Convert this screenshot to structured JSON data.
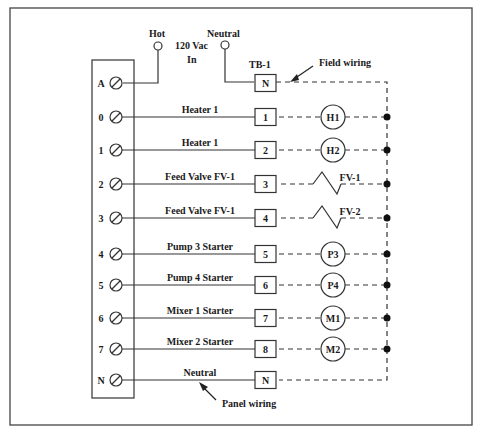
{
  "diagram": {
    "type": "wiring-diagram",
    "frame": {
      "x": 10,
      "y": 8,
      "w": 462,
      "h": 417
    },
    "power_in": {
      "hot_label": "Hot",
      "neutral_label": "Neutral",
      "supply_label_line1": "120 Vac",
      "supply_label_line2": "In"
    },
    "terminal_block_label": "TB-1",
    "annotations": {
      "field_wiring": "Field wiring",
      "panel_wiring": "Panel wiring"
    },
    "rows": [
      {
        "terminal": "A",
        "wire_label": "",
        "tb": "N",
        "device": "",
        "device_type": "none",
        "y": 83
      },
      {
        "terminal": "0",
        "wire_label": "Heater 1",
        "tb": "1",
        "device": "H1",
        "device_type": "circle",
        "y": 117
      },
      {
        "terminal": "1",
        "wire_label": "Heater 1",
        "tb": "2",
        "device": "H2",
        "device_type": "circle",
        "y": 150
      },
      {
        "terminal": "2",
        "wire_label": "Feed Valve FV-1",
        "tb": "3",
        "device": "FV-1",
        "device_type": "valve",
        "y": 184
      },
      {
        "terminal": "3",
        "wire_label": "Feed Valve FV-1",
        "tb": "4",
        "device": "FV-2",
        "device_type": "valve",
        "y": 218
      },
      {
        "terminal": "4",
        "wire_label": "Pump 3 Starter",
        "tb": "5",
        "device": "P3",
        "device_type": "circle",
        "y": 254
      },
      {
        "terminal": "5",
        "wire_label": "Pump 4 Starter",
        "tb": "6",
        "device": "P4",
        "device_type": "circle",
        "y": 285
      },
      {
        "terminal": "6",
        "wire_label": "Mixer  1 Starter",
        "tb": "7",
        "device": "M1",
        "device_type": "circle",
        "y": 318
      },
      {
        "terminal": "7",
        "wire_label": "Mixer  2 Starter",
        "tb": "8",
        "device": "M2",
        "device_type": "circle",
        "y": 349
      },
      {
        "terminal": "N",
        "wire_label": "Neutral",
        "tb": "N",
        "device": "",
        "device_type": "none",
        "y": 380
      }
    ],
    "colors": {
      "line": "#333333",
      "text": "#1a1a1a",
      "background": "#ffffff"
    }
  }
}
